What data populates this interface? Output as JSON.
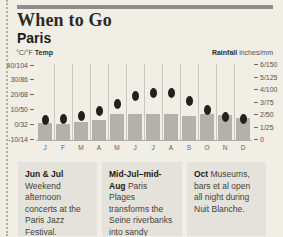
{
  "header": {
    "section_title": "When to Go",
    "city": "Paris"
  },
  "chart": {
    "left_axis": {
      "unit_prefix": "°C/°F",
      "label": "Temp",
      "ticks": [
        "40/104",
        "30/86",
        "20/68",
        "10/50",
        "0/32",
        "-10/14"
      ]
    },
    "right_axis": {
      "label": "Rainfall",
      "unit": "inches/mm",
      "ticks": [
        "6/150",
        "5/125",
        "4/100",
        "3/75",
        "2/50",
        "1/25",
        "0"
      ]
    },
    "months": [
      "J",
      "F",
      "M",
      "A",
      "M",
      "J",
      "J",
      "A",
      "S",
      "O",
      "N",
      "D"
    ]
  },
  "chart_data": {
    "type": "bar",
    "subtype": "climate combo: rainfall bars + temperature dots",
    "categories": [
      "Jan",
      "Feb",
      "Mar",
      "Apr",
      "May",
      "Jun",
      "Jul",
      "Aug",
      "Sep",
      "Oct",
      "Nov",
      "Dec"
    ],
    "x_tick_labels": [
      "J",
      "F",
      "M",
      "A",
      "M",
      "J",
      "J",
      "A",
      "S",
      "O",
      "N",
      "D"
    ],
    "series": [
      {
        "name": "Temp",
        "type": "scatter",
        "unit": "°C",
        "values": [
          3,
          4,
          6,
          9,
          14,
          19,
          21,
          21,
          16,
          10,
          5,
          4
        ]
      },
      {
        "name": "Rainfall",
        "type": "bar",
        "unit": "mm",
        "values": [
          34,
          32,
          35,
          39,
          51,
          51,
          52,
          51,
          48,
          51,
          50,
          43
        ]
      }
    ],
    "left_axis": {
      "label": "°C/°F Temp",
      "range_c": [
        -10,
        40
      ],
      "ticks": [
        "40/104",
        "30/86",
        "20/68",
        "10/50",
        "0/32",
        "-10/14"
      ]
    },
    "right_axis": {
      "label": "Rainfall inches/mm",
      "range_mm": [
        0,
        150
      ],
      "ticks": [
        "6/150",
        "5/125",
        "4/100",
        "3/75",
        "2/50",
        "1/25",
        "0"
      ]
    },
    "legend": "none",
    "grid": "vertical month separators"
  },
  "notes": [
    {
      "lead": "Jun & Jul",
      "text": " Week­end afternoon concerts at the Paris Jazz Festival."
    },
    {
      "lead": "Mid-Jul–mid-Aug",
      "text": " Paris Plages transforms the Seine riverbanks into sandy beaches."
    },
    {
      "lead": "Oct",
      "text": " Museums, bars et al open all night during Nuit Blanche."
    }
  ],
  "colors": {
    "page_background": "#f1eee6",
    "top_rule": "#8d8d8b",
    "bar": "#b3b1aa",
    "temperature_dot": "#22211f",
    "note_background": "#e4e2da",
    "separator": "#c9c7c0"
  }
}
